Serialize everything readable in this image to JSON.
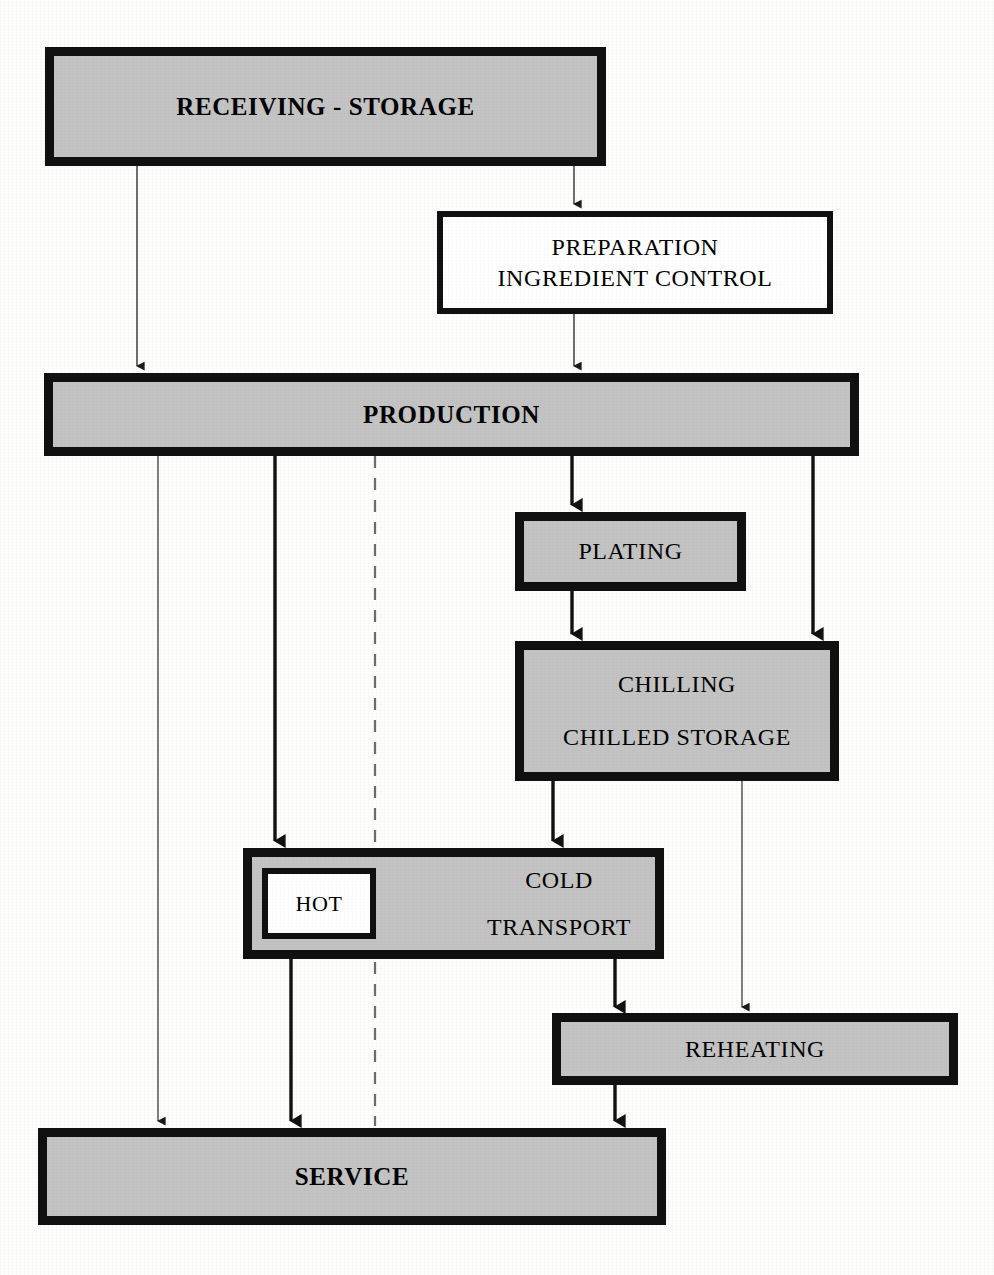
{
  "diagram": {
    "colors": {
      "node_fill": "#c3c3c3",
      "node_fill_white": "#ffffff",
      "border": "#101010",
      "page_background": "#fdfdfc",
      "connector": "#1a1a1a"
    },
    "nodes": [
      {
        "id": "receiving",
        "label": "RECEIVING - STORAGE",
        "lines": [
          "RECEIVING - STORAGE"
        ],
        "fill": "gray",
        "bold": true
      },
      {
        "id": "preparation",
        "label": "PREPARATION INGREDIENT CONTROL",
        "lines": [
          "PREPARATION",
          "INGREDIENT CONTROL"
        ],
        "fill": "white",
        "bold": false
      },
      {
        "id": "production",
        "label": "PRODUCTION",
        "lines": [
          "PRODUCTION"
        ],
        "fill": "gray",
        "bold": true
      },
      {
        "id": "plating",
        "label": "PLATING",
        "lines": [
          "PLATING"
        ],
        "fill": "gray",
        "bold": false
      },
      {
        "id": "chilling",
        "label": "CHILLING CHILLED STORAGE",
        "lines": [
          "CHILLING",
          "CHILLED STORAGE"
        ],
        "fill": "gray",
        "bold": false
      },
      {
        "id": "transport",
        "label": "COLD TRANSPORT",
        "lines": [
          "COLD",
          "TRANSPORT"
        ],
        "fill": "gray",
        "bold": false
      },
      {
        "id": "hot",
        "label": "HOT",
        "lines": [
          "HOT"
        ],
        "fill": "white",
        "bold": false
      },
      {
        "id": "reheating",
        "label": "REHEATING",
        "lines": [
          "REHEATING"
        ],
        "fill": "gray",
        "bold": false
      },
      {
        "id": "service",
        "label": "SERVICE",
        "lines": [
          "SERVICE"
        ],
        "fill": "gray",
        "bold": true
      }
    ],
    "edges": [
      {
        "id": "receiving-to-production",
        "from": "receiving",
        "to": "production",
        "style": "thin",
        "arrow": true
      },
      {
        "id": "receiving-to-preparation",
        "from": "receiving",
        "to": "preparation",
        "style": "thin",
        "arrow": true
      },
      {
        "id": "preparation-to-production",
        "from": "preparation",
        "to": "production",
        "style": "thin",
        "arrow": true
      },
      {
        "id": "production-to-service",
        "from": "production",
        "to": "service",
        "style": "thin",
        "arrow": true
      },
      {
        "id": "production-to-transport",
        "from": "production",
        "to": "transport",
        "style": "thick",
        "arrow": true
      },
      {
        "id": "production-to-plating",
        "from": "production",
        "to": "plating",
        "style": "thick",
        "arrow": true
      },
      {
        "id": "production-to-chilling",
        "from": "production",
        "to": "chilling",
        "style": "thick",
        "arrow": true
      },
      {
        "id": "production-to-service-dashed",
        "from": "production",
        "to": "service",
        "style": "dashed",
        "arrow": false
      },
      {
        "id": "plating-to-chilling",
        "from": "plating",
        "to": "chilling",
        "style": "thick",
        "arrow": true
      },
      {
        "id": "chilling-to-transport",
        "from": "chilling",
        "to": "transport",
        "style": "thick",
        "arrow": true
      },
      {
        "id": "chilling-to-reheating",
        "from": "chilling",
        "to": "reheating",
        "style": "thin",
        "arrow": true
      },
      {
        "id": "transport-hot-to-service",
        "from": "transport",
        "to": "service",
        "style": "thick",
        "arrow": true
      },
      {
        "id": "transport-cold-to-reheating",
        "from": "transport",
        "to": "reheating",
        "style": "thick",
        "arrow": true
      },
      {
        "id": "reheating-to-service",
        "from": "reheating",
        "to": "service",
        "style": "thick",
        "arrow": true
      }
    ]
  }
}
